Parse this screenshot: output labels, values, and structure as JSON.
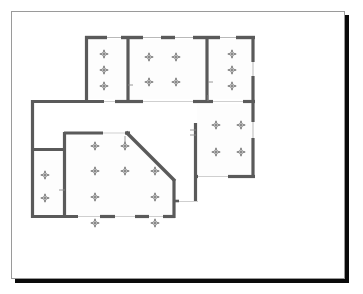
{
  "document": {
    "kind": "architectural-floor-plan",
    "sheet_background": "#ffffff",
    "sheet_border_color": "#9a9a9a",
    "shadow_color": "#0a0a0a",
    "wall_color": "#5a5a5a",
    "wall_color_light": "#8d8d8d",
    "fixture_color": "#5a5a5a",
    "canvas": {
      "width": 363,
      "height": 294
    }
  },
  "chart_data": {
    "type": "diagram",
    "title": "",
    "subtitle": "",
    "view_box": {
      "width": 334,
      "height": 268
    },
    "legend": [],
    "annotations": [],
    "rooms": [
      {
        "id": "room-top-left",
        "name": "Top Left Room",
        "shape": "rect",
        "x": 73,
        "y": 24,
        "w": 40,
        "h": 63,
        "fixture_count": 3
      },
      {
        "id": "room-top-middle",
        "name": "Top Middle Room",
        "shape": "rect",
        "x": 118,
        "y": 24,
        "w": 74,
        "h": 63,
        "fixture_count": 4
      },
      {
        "id": "room-top-right",
        "name": "Top Right Room",
        "shape": "rect",
        "x": 197,
        "y": 24,
        "w": 46,
        "h": 63,
        "fixture_count": 3
      },
      {
        "id": "room-right-lower",
        "name": "Right Lower Room",
        "shape": "rect",
        "x": 185,
        "y": 92,
        "w": 58,
        "h": 72,
        "fixture_count": 4
      },
      {
        "id": "room-main-hall",
        "name": "Main Hall",
        "shape": "polygon-chamfered",
        "fixture_count": 9
      },
      {
        "id": "room-left-small",
        "name": "Left Small Room",
        "shape": "rect",
        "x": 20,
        "y": 137,
        "w": 30,
        "h": 68,
        "fixture_count": 2
      }
    ],
    "fixtures": [
      {
        "room": "room-top-left",
        "x": 92,
        "y": 42
      },
      {
        "room": "room-top-left",
        "x": 92,
        "y": 58
      },
      {
        "room": "room-top-left",
        "x": 92,
        "y": 74
      },
      {
        "room": "room-top-middle",
        "x": 137,
        "y": 45
      },
      {
        "room": "room-top-middle",
        "x": 164,
        "y": 45
      },
      {
        "room": "room-top-middle",
        "x": 137,
        "y": 70
      },
      {
        "room": "room-top-middle",
        "x": 164,
        "y": 70
      },
      {
        "room": "room-top-right",
        "x": 220,
        "y": 42
      },
      {
        "room": "room-top-right",
        "x": 220,
        "y": 58
      },
      {
        "room": "room-top-right",
        "x": 220,
        "y": 74
      },
      {
        "room": "room-right-lower",
        "x": 204,
        "y": 113
      },
      {
        "room": "room-right-lower",
        "x": 229,
        "y": 113
      },
      {
        "room": "room-right-lower",
        "x": 204,
        "y": 140
      },
      {
        "room": "room-right-lower",
        "x": 229,
        "y": 140
      },
      {
        "room": "room-main-hall",
        "x": 83,
        "y": 134
      },
      {
        "room": "room-main-hall",
        "x": 113,
        "y": 134
      },
      {
        "room": "room-main-hall",
        "x": 83,
        "y": 159
      },
      {
        "room": "room-main-hall",
        "x": 113,
        "y": 159
      },
      {
        "room": "room-main-hall",
        "x": 143,
        "y": 159
      },
      {
        "room": "room-main-hall",
        "x": 83,
        "y": 185
      },
      {
        "room": "room-main-hall",
        "x": 143,
        "y": 185
      },
      {
        "room": "room-main-hall",
        "x": 83,
        "y": 211
      },
      {
        "room": "room-main-hall",
        "x": 143,
        "y": 211
      },
      {
        "room": "room-left-small",
        "x": 33,
        "y": 163
      },
      {
        "room": "room-left-small",
        "x": 33,
        "y": 186
      }
    ],
    "walls": [
      {
        "id": "w-top-outer",
        "kind": "exterior",
        "x1": 73,
        "y1": 25,
        "x2": 243,
        "y2": 25
      },
      {
        "id": "w-topleft-left",
        "kind": "exterior",
        "x1": 74,
        "y1": 25,
        "x2": 74,
        "y2": 89
      },
      {
        "id": "w-topright-right",
        "kind": "exterior",
        "x1": 242,
        "y1": 25,
        "x2": 242,
        "y2": 89
      },
      {
        "id": "w-div-topleft",
        "kind": "interior",
        "x1": 115,
        "y1": 25,
        "x2": 115,
        "y2": 89
      },
      {
        "id": "w-div-topright",
        "kind": "interior",
        "x1": 195,
        "y1": 25,
        "x2": 195,
        "y2": 89
      },
      {
        "id": "w-mid-horizontal",
        "kind": "interior",
        "x1": 74,
        "y1": 89,
        "x2": 243,
        "y2": 89
      },
      {
        "id": "w-left-upper",
        "kind": "exterior",
        "x1": 20,
        "y1": 89,
        "x2": 74,
        "y2": 89
      },
      {
        "id": "w-left-outer",
        "kind": "exterior",
        "x1": 20,
        "y1": 89,
        "x2": 20,
        "y2": 206
      },
      {
        "id": "w-bottom-outer",
        "kind": "exterior",
        "x1": 20,
        "y1": 205,
        "x2": 145,
        "y2": 205
      },
      {
        "id": "w-hall-top",
        "kind": "interior",
        "x1": 52,
        "y1": 120,
        "x2": 115,
        "y2": 120
      },
      {
        "id": "w-hall-left",
        "kind": "interior",
        "x1": 52,
        "y1": 120,
        "x2": 52,
        "y2": 205
      },
      {
        "id": "w-hall-chamfer",
        "kind": "exterior",
        "x1": 115,
        "y1": 120,
        "x2": 163,
        "y2": 168
      },
      {
        "id": "w-hall-right",
        "kind": "exterior",
        "x1": 163,
        "y1": 168,
        "x2": 163,
        "y2": 205
      },
      {
        "id": "w-hall-bottom",
        "kind": "exterior",
        "x1": 52,
        "y1": 205,
        "x2": 163,
        "y2": 205
      },
      {
        "id": "w-leftsmall-top",
        "kind": "interior",
        "x1": 20,
        "y1": 137,
        "x2": 52,
        "y2": 137
      },
      {
        "id": "w-right-outer",
        "kind": "exterior",
        "x1": 242,
        "y1": 89,
        "x2": 242,
        "y2": 165
      },
      {
        "id": "w-right-bottom",
        "kind": "exterior",
        "x1": 182,
        "y1": 165,
        "x2": 243,
        "y2": 165
      },
      {
        "id": "w-right-inner-vert",
        "kind": "interior",
        "x1": 183,
        "y1": 112,
        "x2": 183,
        "y2": 190
      }
    ],
    "openings": [
      {
        "id": "window-top-1",
        "type": "window",
        "x": 95,
        "y": 25,
        "w": 14,
        "orientation": "horizontal"
      },
      {
        "id": "window-top-2",
        "type": "window",
        "x": 131,
        "y": 25,
        "w": 18,
        "orientation": "horizontal"
      },
      {
        "id": "window-top-3",
        "type": "window",
        "x": 163,
        "y": 25,
        "w": 18,
        "orientation": "horizontal"
      },
      {
        "id": "window-top-4",
        "type": "window",
        "x": 208,
        "y": 25,
        "w": 16,
        "orientation": "horizontal"
      },
      {
        "id": "door-mid-1",
        "type": "door",
        "x": 92,
        "y": 89,
        "w": 20,
        "orientation": "horizontal"
      },
      {
        "id": "door-mid-2",
        "type": "door",
        "x": 131,
        "y": 89,
        "w": 50,
        "orientation": "horizontal"
      },
      {
        "id": "door-mid-3",
        "type": "door",
        "x": 201,
        "y": 89,
        "w": 30,
        "orientation": "horizontal"
      },
      {
        "id": "door-hall-top",
        "type": "door",
        "x": 91,
        "y": 120,
        "w": 22,
        "orientation": "horizontal"
      },
      {
        "id": "door-hall-bot-1",
        "type": "door",
        "x": 66,
        "y": 205,
        "w": 22,
        "orientation": "horizontal"
      },
      {
        "id": "door-hall-bot-2",
        "type": "door",
        "x": 103,
        "y": 205,
        "w": 20,
        "orientation": "horizontal"
      },
      {
        "id": "door-hall-bot-3",
        "type": "door",
        "x": 137,
        "y": 205,
        "w": 14,
        "orientation": "horizontal"
      },
      {
        "id": "window-right-1",
        "type": "window",
        "x": 242,
        "y": 50,
        "h": 14,
        "orientation": "vertical"
      },
      {
        "id": "window-right-2",
        "type": "window",
        "x": 242,
        "y": 110,
        "h": 16,
        "orientation": "vertical"
      },
      {
        "id": "door-right-bot",
        "type": "door",
        "x": 186,
        "y": 165,
        "w": 30,
        "orientation": "horizontal"
      }
    ]
  }
}
